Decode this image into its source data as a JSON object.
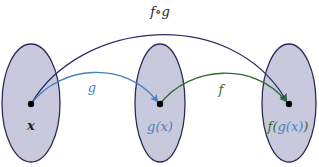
{
  "diagram": {
    "title_label": "f∘g",
    "sets": [
      {
        "name": "domain-set",
        "point_label": "x"
      },
      {
        "name": "intermediate-set",
        "point_label": "g(x)"
      },
      {
        "name": "codomain-set",
        "point_label": "f(g(x))"
      }
    ],
    "arrows": [
      {
        "name": "g",
        "label": "g",
        "color": "#4a7fc0"
      },
      {
        "name": "f",
        "label": "f",
        "color": "#2e6b2e"
      },
      {
        "name": "composite",
        "label": "f∘g",
        "color": "#2a2f6b"
      }
    ],
    "colors": {
      "set_fill": "#c8c9dc",
      "set_stroke": "#2a2d55",
      "point": "#000000",
      "text_dark": "#222222",
      "text_g": "#4a7fc0",
      "text_f": "#2e6b2e"
    }
  }
}
